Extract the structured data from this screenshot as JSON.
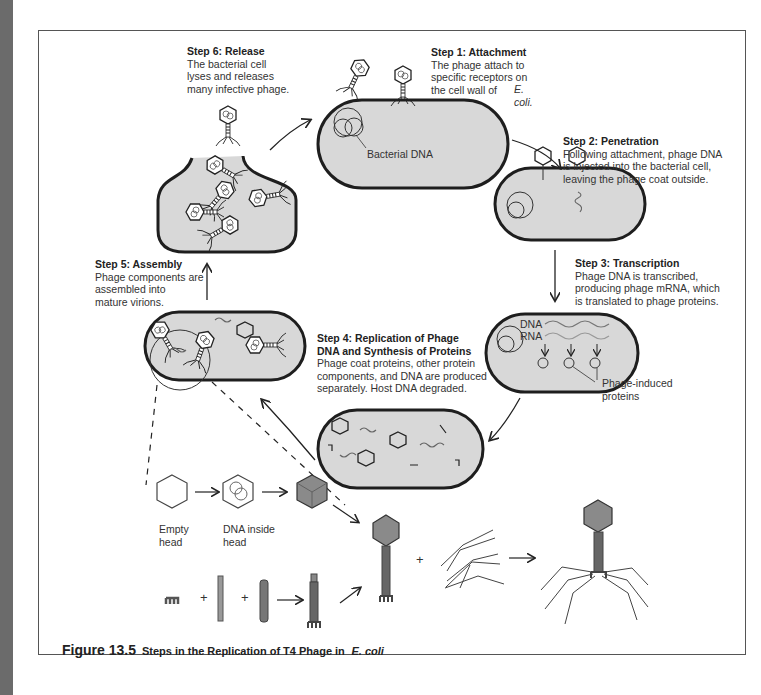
{
  "figure": {
    "number_label": "Figure 13.5",
    "title": "Steps in the Replication of T4 Phage in",
    "title_italic": "E. coli"
  },
  "steps": [
    {
      "id": 1,
      "title": "Step 1: Attachment",
      "body": "The phage attach to\nspecific receptors on\nthe cell wall of",
      "body_italic": "E. coli."
    },
    {
      "id": 2,
      "title": "Step 2: Penetration",
      "body": "Following attachment, phage DNA\nis injected into the bacterial cell,\nleaving the phage coat outside."
    },
    {
      "id": 3,
      "title": "Step 3: Transcription",
      "body": "Phage DNA is transcribed,\nproducing phage mRNA, which\nis translated to phage proteins."
    },
    {
      "id": 4,
      "title_line1": "Step 4: Replication of Phage",
      "title_line2": "DNA and Synthesis of Proteins",
      "body": "Phage coat proteins, other protein\ncomponents, and DNA are produced\nseparately. Host DNA degraded."
    },
    {
      "id": 5,
      "title": "Step 5: Assembly",
      "body": "Phage components are\nassembled into\nmature virions."
    },
    {
      "id": 6,
      "title": "Step 6: Release",
      "body": "The bacterial cell\nlyses and releases\nmany infective phage."
    }
  ],
  "labels": {
    "bacterial_dna": "Bacterial DNA",
    "dna": "DNA",
    "rna": "RNA",
    "phage_induced_proteins": "Phage-induced\nproteins",
    "empty_head": "Empty\nhead",
    "dna_inside_head": "DNA inside\nhead",
    "plus": "+"
  },
  "colors": {
    "cell_fill": "#d8d8d8",
    "cell_stroke": "#1e1e1e",
    "capsid_fill": "#8a8a8a",
    "edge_strip": "#6b6b6b"
  }
}
